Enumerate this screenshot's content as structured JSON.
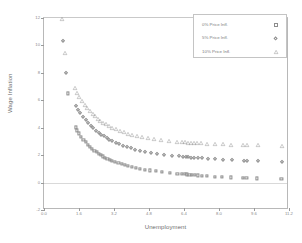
{
  "chart_data": {
    "type": "scatter",
    "title": "",
    "xlabel": "Unemployment",
    "ylabel": "Wage Inflation",
    "xlim": [
      0.0,
      11.2
    ],
    "ylim": [
      -2,
      12
    ],
    "xticks": [
      "0.0",
      "1.6",
      "3.2",
      "4.8",
      "6.4",
      "8.0",
      "9.6",
      "11.2"
    ],
    "xtick_values": [
      0.0,
      1.6,
      3.2,
      4.8,
      6.4,
      8.0,
      9.6,
      11.2
    ],
    "yticks": [
      "12",
      "10",
      "8",
      "6",
      "4",
      "2",
      "0",
      "-2"
    ],
    "ytick_values": [
      12,
      10,
      8,
      6,
      4,
      2,
      0,
      -2
    ],
    "grid": "zero-line-only",
    "legend_position": "top-right",
    "series": [
      {
        "name": "0% Price Infl.",
        "marker": "square",
        "color": "#8d8d8d",
        "points": [
          [
            1.1,
            6.5
          ],
          [
            1.45,
            4.02
          ],
          [
            1.52,
            3.8
          ],
          [
            1.6,
            3.58
          ],
          [
            1.7,
            3.34
          ],
          [
            1.8,
            3.12
          ],
          [
            1.9,
            2.94
          ],
          [
            2.0,
            2.76
          ],
          [
            2.1,
            2.6
          ],
          [
            2.2,
            2.46
          ],
          [
            2.3,
            2.33
          ],
          [
            2.4,
            2.21
          ],
          [
            2.5,
            2.1
          ],
          [
            2.6,
            2.0
          ],
          [
            2.7,
            1.91
          ],
          [
            2.8,
            1.82
          ],
          [
            2.9,
            1.74
          ],
          [
            3.0,
            1.67
          ],
          [
            3.1,
            1.6
          ],
          [
            3.25,
            1.5
          ],
          [
            3.4,
            1.42
          ],
          [
            3.55,
            1.34
          ],
          [
            3.7,
            1.27
          ],
          [
            3.85,
            1.21
          ],
          [
            4.0,
            1.15
          ],
          [
            4.2,
            1.08
          ],
          [
            4.4,
            1.01
          ],
          [
            4.6,
            0.95
          ],
          [
            4.85,
            0.89
          ],
          [
            5.1,
            0.83
          ],
          [
            5.4,
            0.77
          ],
          [
            5.75,
            0.71
          ],
          [
            6.1,
            0.66
          ],
          [
            6.3,
            0.63
          ],
          [
            6.45,
            0.61
          ],
          [
            6.55,
            0.59
          ],
          [
            6.65,
            0.58
          ],
          [
            6.75,
            0.56
          ],
          [
            6.9,
            0.54
          ],
          [
            7.05,
            0.52
          ],
          [
            7.2,
            0.5
          ],
          [
            7.45,
            0.47
          ],
          [
            7.8,
            0.44
          ],
          [
            8.15,
            0.41
          ],
          [
            8.55,
            0.38
          ],
          [
            9.1,
            0.34
          ],
          [
            9.25,
            0.33
          ],
          [
            9.75,
            0.3
          ],
          [
            10.85,
            0.24
          ]
        ]
      },
      {
        "name": "5% Price Infl.",
        "marker": "diamond",
        "color": "#8d8d8d",
        "points": [
          [
            0.88,
            10.35
          ],
          [
            1.02,
            8.02
          ],
          [
            1.45,
            5.6
          ],
          [
            1.55,
            5.32
          ],
          [
            1.66,
            5.06
          ],
          [
            1.78,
            4.8
          ],
          [
            1.9,
            4.56
          ],
          [
            2.02,
            4.34
          ],
          [
            2.14,
            4.14
          ],
          [
            2.26,
            3.96
          ],
          [
            2.38,
            3.79
          ],
          [
            2.5,
            3.63
          ],
          [
            2.62,
            3.49
          ],
          [
            2.74,
            3.36
          ],
          [
            2.86,
            3.24
          ],
          [
            2.98,
            3.13
          ],
          [
            3.12,
            3.01
          ],
          [
            3.28,
            2.89
          ],
          [
            3.44,
            2.79
          ],
          [
            3.6,
            2.69
          ],
          [
            3.78,
            2.59
          ],
          [
            3.96,
            2.5
          ],
          [
            4.16,
            2.41
          ],
          [
            4.38,
            2.33
          ],
          [
            4.62,
            2.25
          ],
          [
            4.88,
            2.17
          ],
          [
            5.16,
            2.1
          ],
          [
            5.48,
            2.03
          ],
          [
            5.84,
            1.96
          ],
          [
            6.16,
            1.91
          ],
          [
            6.34,
            1.88
          ],
          [
            6.48,
            1.86
          ],
          [
            6.6,
            1.84
          ],
          [
            6.72,
            1.82
          ],
          [
            6.86,
            1.8
          ],
          [
            7.02,
            1.78
          ],
          [
            7.2,
            1.76
          ],
          [
            7.48,
            1.73
          ],
          [
            7.82,
            1.7
          ],
          [
            8.18,
            1.67
          ],
          [
            8.58,
            1.64
          ],
          [
            9.12,
            1.6
          ],
          [
            9.28,
            1.59
          ],
          [
            9.78,
            1.56
          ],
          [
            10.88,
            1.49
          ]
        ]
      },
      {
        "name": "10% Price Infl.",
        "marker": "triangle",
        "color": "#8d8d8d",
        "points": [
          [
            0.82,
            11.9
          ],
          [
            0.98,
            9.42
          ],
          [
            1.4,
            6.88
          ],
          [
            1.5,
            6.55
          ],
          [
            1.62,
            6.24
          ],
          [
            1.74,
            5.95
          ],
          [
            1.86,
            5.68
          ],
          [
            1.98,
            5.44
          ],
          [
            2.1,
            5.22
          ],
          [
            2.22,
            5.02
          ],
          [
            2.34,
            4.84
          ],
          [
            2.46,
            4.67
          ],
          [
            2.58,
            4.52
          ],
          [
            2.7,
            4.38
          ],
          [
            2.82,
            4.25
          ],
          [
            2.96,
            4.12
          ],
          [
            3.12,
            3.99
          ],
          [
            3.28,
            3.87
          ],
          [
            3.46,
            3.76
          ],
          [
            3.64,
            3.66
          ],
          [
            3.84,
            3.56
          ],
          [
            4.04,
            3.47
          ],
          [
            4.26,
            3.39
          ],
          [
            4.5,
            3.31
          ],
          [
            4.76,
            3.23
          ],
          [
            5.04,
            3.16
          ],
          [
            5.36,
            3.09
          ],
          [
            5.72,
            3.03
          ],
          [
            6.08,
            2.98
          ],
          [
            6.3,
            2.95
          ],
          [
            6.46,
            2.93
          ],
          [
            6.58,
            2.92
          ],
          [
            6.7,
            2.91
          ],
          [
            6.84,
            2.89
          ],
          [
            7.0,
            2.88
          ],
          [
            7.18,
            2.86
          ],
          [
            7.46,
            2.84
          ],
          [
            7.8,
            2.82
          ],
          [
            8.16,
            2.8
          ],
          [
            8.56,
            2.77
          ],
          [
            9.1,
            2.75
          ],
          [
            9.26,
            2.74
          ],
          [
            9.76,
            2.72
          ],
          [
            10.86,
            2.67
          ]
        ]
      }
    ]
  },
  "legend": {
    "items": [
      {
        "label": "0% Price Infl.",
        "marker": "square"
      },
      {
        "label": "5% Price Infl.",
        "marker": "diamond"
      },
      {
        "label": "10% Price Infl.",
        "marker": "triangle"
      }
    ]
  }
}
